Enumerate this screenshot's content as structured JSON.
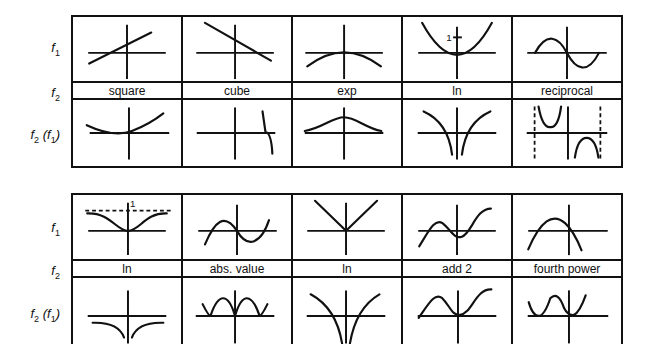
{
  "row_labels": {
    "f1": "f",
    "f1_sub": "1",
    "f2": "f",
    "f2_sub": "2",
    "composite": "f",
    "composite_sub": "2",
    "composite_inner": "(f",
    "composite_inner_sub": "1",
    "composite_close": ")"
  },
  "tables": [
    {
      "f2_labels": [
        "square",
        "cube",
        "exp",
        "ln",
        "reciprocal"
      ],
      "f1_graphs": [
        "line-increasing",
        "line-decreasing",
        "parabola-down-at-origin",
        "parabola-up-vertex-at-1",
        "sine-wave"
      ],
      "composite_graphs": [
        "shifted-parabola",
        "cubic-vertical",
        "bell-curve",
        "symmetric-log-cusps",
        "reciprocal-sine-with-asymptotes"
      ],
      "annotations": {
        "ln_f1_tick": "1"
      }
    },
    {
      "f2_labels": [
        "ln",
        "abs. value",
        "ln",
        "add 2",
        "fourth power"
      ],
      "f1_graphs": [
        "inverted-bell-asymptote-1",
        "sine-wave",
        "v-shape",
        "cubic-wave",
        "parabola-down"
      ],
      "composite_graphs": [
        "log-negative-cusps",
        "abs-sine",
        "log-v-cusps",
        "shifted-cubic-wave",
        "w-shape"
      ],
      "annotations": {
        "ln_f1_asymptote": "1"
      }
    }
  ]
}
